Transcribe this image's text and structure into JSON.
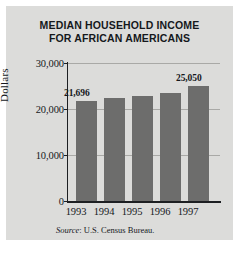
{
  "figure": {
    "background": "#dcdcda",
    "title_lines": [
      "MEDIAN HOUSEHOLD INCOME",
      "FOR AFRICAN AMERICANS"
    ],
    "source_prefix": "Source",
    "source_text": ": U.S. Census Bureau."
  },
  "chart_data": {
    "type": "bar",
    "title": "MEDIAN HOUSEHOLD INCOME FOR AFRICAN AMERICANS",
    "xlabel": "",
    "ylabel": "Dollars",
    "categories": [
      "1993",
      "1994",
      "1995",
      "1996",
      "1997"
    ],
    "values": [
      21696,
      22400,
      22800,
      23500,
      25050
    ],
    "value_labels": [
      "21,696",
      "",
      "",
      "",
      "25,050"
    ],
    "ylim": [
      0,
      30000
    ],
    "yticks": [
      0,
      10000,
      20000,
      30000
    ],
    "ytick_labels": [
      "0",
      "10,000",
      "20,000",
      "30,000"
    ],
    "grid": true,
    "legend": false,
    "bar_color": "#6d6d6c",
    "axis_color": "#1d1f22",
    "grid_color": "#a9a9a6",
    "source": "Source: U.S. Census Bureau."
  }
}
